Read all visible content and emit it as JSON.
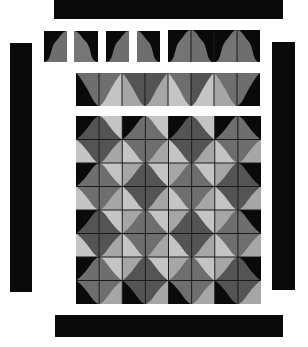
{
  "colors": {
    "black": "#0a0a0a",
    "dark": "#545454",
    "mid": "#6e6e6e",
    "light": "#a6a6a6",
    "lighter": "#c4c4c4",
    "line": "#1a1a1a"
  },
  "borders": {
    "top": {
      "x": 54,
      "y": 0,
      "w": 229,
      "h": 19
    },
    "left": {
      "x": 10,
      "y": 43,
      "w": 22,
      "h": 249
    },
    "right": {
      "x": 272,
      "y": 42,
      "w": 23,
      "h": 248
    },
    "bottom": {
      "x": 55,
      "y": 315,
      "w": 228,
      "h": 22
    }
  },
  "single_blocks": [
    {
      "x": 44,
      "y": 31,
      "w": 23,
      "h": 31,
      "bg": "#0a0a0a",
      "fg": "#6e6e6e",
      "orient": "left-rise"
    },
    {
      "x": 74,
      "y": 31,
      "w": 24,
      "h": 31,
      "bg": "#0a0a0a",
      "fg": "#767676",
      "orient": "right-rise"
    },
    {
      "x": 106,
      "y": 31,
      "w": 23,
      "h": 31,
      "bg": "#0a0a0a",
      "fg": "#6e6e6e",
      "orient": "left-rise"
    },
    {
      "x": 137,
      "y": 31,
      "w": 23,
      "h": 31,
      "bg": "#0a0a0a",
      "fg": "#6e6e6e",
      "orient": "right-rise"
    }
  ],
  "wide_block": {
    "x": 168,
    "y": 30,
    "w": 92,
    "h": 32,
    "cells": 4
  },
  "strip": {
    "x": 76,
    "y": 73,
    "w": 184,
    "h": 33,
    "cols": 8
  },
  "main_grid": {
    "x": 76,
    "y": 116,
    "w": 185,
    "h": 188,
    "cols": 8,
    "rows": 8
  }
}
